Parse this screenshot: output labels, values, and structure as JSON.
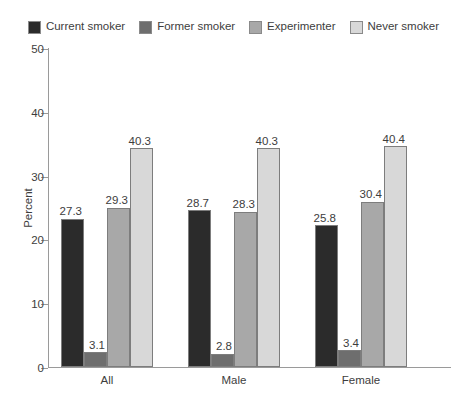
{
  "chart_data": {
    "type": "bar",
    "title": "",
    "xlabel": "",
    "ylabel": "Percent",
    "ylim": [
      0,
      50
    ],
    "yticks": [
      0,
      10,
      20,
      30,
      40,
      50
    ],
    "grid": false,
    "legend_position": "top",
    "categories": [
      "All",
      "Male",
      "Female"
    ],
    "series": [
      {
        "name": "Current smoker",
        "color": "#2b2b2b",
        "values": [
          27.3,
          28.7,
          25.8
        ]
      },
      {
        "name": "Former smoker",
        "color": "#6e6e6e",
        "values": [
          3.1,
          2.8,
          3.4
        ]
      },
      {
        "name": "Experimenter",
        "color": "#a8a8a8",
        "values": [
          29.3,
          28.3,
          30.4
        ]
      },
      {
        "name": "Never smoker",
        "color": "#d8d8d8",
        "values": [
          40.3,
          40.3,
          40.4
        ]
      }
    ],
    "bar_heights": {
      "note": "plotted bar tops read off the axis, which sit slightly below the printed data labels",
      "All": [
        23.2,
        2.3,
        25.0,
        34.3
      ],
      "Male": [
        24.6,
        2.1,
        24.3,
        34.3
      ],
      "Female": [
        22.2,
        2.6,
        25.9,
        34.6
      ]
    },
    "data_labels": {
      "All": [
        "27.3",
        "3.1",
        "29.3",
        "40.3"
      ],
      "Male": [
        "28.7",
        "2.8",
        "28.3",
        "40.3"
      ],
      "Female": [
        "25.8",
        "3.4",
        "30.4",
        "40.4"
      ]
    }
  },
  "legend": {
    "items": [
      {
        "label": "Current smoker",
        "color": "#2b2b2b"
      },
      {
        "label": "Former smoker",
        "color": "#6e6e6e"
      },
      {
        "label": "Experimenter",
        "color": "#a8a8a8"
      },
      {
        "label": "Never smoker",
        "color": "#d8d8d8"
      }
    ]
  },
  "axis": {
    "y_title": "Percent",
    "y_tick_labels": [
      "0",
      "10",
      "20",
      "30",
      "40",
      "50"
    ],
    "x_tick_labels": [
      "All",
      "Male",
      "Female"
    ]
  }
}
